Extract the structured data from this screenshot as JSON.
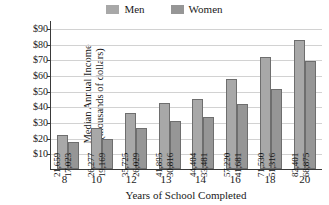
{
  "chart_data": {
    "type": "bar",
    "title": "",
    "categories": [
      "8",
      "10",
      "12",
      "13",
      "14",
      "16",
      "18",
      "20"
    ],
    "series": [
      {
        "name": "Men",
        "color": "#a8a8a8",
        "values": [
          21659,
          26277,
          35725,
          41895,
          44404,
          57220,
          71530,
          82401
        ],
        "labels": [
          "21,659",
          "26,277",
          "35,725",
          "41,895",
          "44,404",
          "57,220",
          "71,530",
          "82,401"
        ]
      },
      {
        "name": "Women",
        "color": "#969696",
        "values": [
          17023,
          19169,
          26029,
          30816,
          33481,
          41681,
          51316,
          68875
        ],
        "labels": [
          "17,023",
          "19,169",
          "26,029",
          "30,816",
          "33,481",
          "41,681",
          "51,316",
          "68,875"
        ]
      }
    ],
    "xlabel": "Years of School Completed",
    "ylabel_line1": "Median Annual Income",
    "ylabel_line2": "(thousands of dollars)",
    "ylim": [
      0,
      95000
    ],
    "yticks": [
      10000,
      20000,
      30000,
      40000,
      50000,
      60000,
      70000,
      80000,
      90000
    ],
    "ytick_labels": [
      "$10",
      "$20",
      "$30",
      "$40",
      "$50",
      "$60",
      "$70",
      "$80",
      "$90"
    ],
    "grid": true,
    "legend_position": "top-center",
    "legend": [
      {
        "label": "Men",
        "swatch_color": "#a8a8a8"
      },
      {
        "label": "Women",
        "swatch_color": "#969696"
      }
    ]
  }
}
